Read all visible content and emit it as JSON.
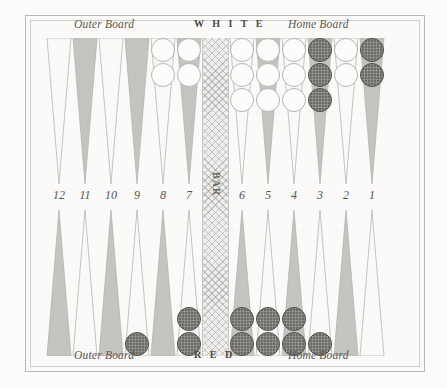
{
  "board": {
    "title": "Backgammon Board Diagram",
    "top_labels": {
      "outer": "Outer Board",
      "player": "W H I T E",
      "home": "Home Board"
    },
    "bottom_labels": {
      "outer": "Outer Board",
      "player": "R E D",
      "home": "Home Board"
    },
    "bar_label": "BAR",
    "point_numbers": [
      "12",
      "11",
      "10",
      "9",
      "8",
      "7",
      "6",
      "5",
      "4",
      "3",
      "2",
      "1"
    ],
    "colors": {
      "paper": "#fdfdfc",
      "frame": "#b9b8b4",
      "triangle_shaded": "#b0aea9",
      "triangle_light": "#fbfaf8",
      "checker_white": "#fdfdfc",
      "checker_red": "#6f6d68",
      "bar_fill": "#efeeec",
      "text": "#57554f"
    },
    "points": [
      {
        "number": "12",
        "half": "top",
        "shade": "light",
        "checkers": 0,
        "color": ""
      },
      {
        "number": "11",
        "half": "top",
        "shade": "dark",
        "checkers": 0,
        "color": ""
      },
      {
        "number": "10",
        "half": "top",
        "shade": "light",
        "checkers": 0,
        "color": ""
      },
      {
        "number": "9",
        "half": "top",
        "shade": "dark",
        "checkers": 0,
        "color": ""
      },
      {
        "number": "8",
        "half": "top",
        "shade": "light",
        "checkers": 2,
        "color": "white"
      },
      {
        "number": "7",
        "half": "top",
        "shade": "dark",
        "checkers": 2,
        "color": "white"
      },
      {
        "number": "6",
        "half": "top",
        "shade": "light",
        "checkers": 3,
        "color": "white"
      },
      {
        "number": "5",
        "half": "top",
        "shade": "dark",
        "checkers": 3,
        "color": "white"
      },
      {
        "number": "4",
        "half": "top",
        "shade": "light",
        "checkers": 3,
        "color": "white"
      },
      {
        "number": "3",
        "half": "top",
        "shade": "dark",
        "checkers": 3,
        "color": "red"
      },
      {
        "number": "2",
        "half": "top",
        "shade": "light",
        "checkers": 2,
        "color": "white"
      },
      {
        "number": "1",
        "half": "top",
        "shade": "dark",
        "checkers": 2,
        "color": "red"
      },
      {
        "number": "12",
        "half": "bottom",
        "shade": "dark",
        "checkers": 0,
        "color": ""
      },
      {
        "number": "11",
        "half": "bottom",
        "shade": "light",
        "checkers": 0,
        "color": ""
      },
      {
        "number": "10",
        "half": "bottom",
        "shade": "dark",
        "checkers": 0,
        "color": ""
      },
      {
        "number": "9",
        "half": "bottom",
        "shade": "light",
        "checkers": 1,
        "color": "red"
      },
      {
        "number": "8",
        "half": "bottom",
        "shade": "dark",
        "checkers": 0,
        "color": ""
      },
      {
        "number": "7",
        "half": "bottom",
        "shade": "light",
        "checkers": 2,
        "color": "red"
      },
      {
        "number": "6",
        "half": "bottom",
        "shade": "dark",
        "checkers": 2,
        "color": "red"
      },
      {
        "number": "5",
        "half": "bottom",
        "shade": "light",
        "checkers": 2,
        "color": "red"
      },
      {
        "number": "4",
        "half": "bottom",
        "shade": "dark",
        "checkers": 2,
        "color": "red"
      },
      {
        "number": "3",
        "half": "bottom",
        "shade": "light",
        "checkers": 1,
        "color": "red"
      },
      {
        "number": "2",
        "half": "bottom",
        "shade": "dark",
        "checkers": 0,
        "color": ""
      },
      {
        "number": "1",
        "half": "bottom",
        "shade": "light",
        "checkers": 0,
        "color": ""
      }
    ]
  }
}
